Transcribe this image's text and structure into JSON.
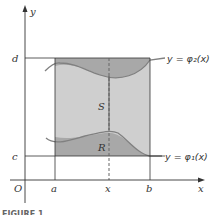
{
  "diagram": {
    "axes": {
      "x_label": "x",
      "y_label": "y",
      "origin_label": "O"
    },
    "x_ticks": [
      "a",
      "x",
      "b"
    ],
    "y_ticks": [
      "d",
      "c"
    ],
    "curves": {
      "upper": "y = φ₂(x)",
      "lower": "y = φ₁(x)"
    },
    "regions": {
      "rectangle": "S",
      "between_curves": "R"
    },
    "caption": "FIGURE 1"
  },
  "colors": {
    "rect_fill": "#cfcfcf",
    "region_fill": "#a8a8a8",
    "line": "#333333",
    "curve": "#808080"
  }
}
